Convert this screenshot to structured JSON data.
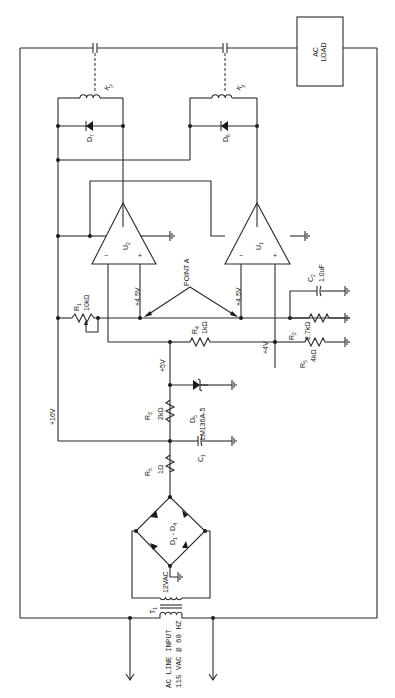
{
  "diagram": {
    "type": "circuit-schematic",
    "orientation": "rotated-90-ccw",
    "blocks": {
      "ac_load": {
        "line1": "AC",
        "line2": "LOAD"
      },
      "ac_input": {
        "line1": "AC LINE INPUT",
        "line2": "115 VAC @ 60 HZ"
      }
    },
    "components": {
      "T1": {
        "ref": "T",
        "sub": "1",
        "value": "12VAC"
      },
      "bridge": {
        "ref": "D",
        "sub1": "1",
        "dash": " - ",
        "ref2": "D",
        "sub2": "4"
      },
      "R5a": {
        "ref": "R",
        "sub": "5",
        "value": "1Ω"
      },
      "C1": {
        "ref": "C",
        "sub": "1"
      },
      "R3": {
        "ref": "R",
        "sub": "3",
        "value": "2kΩ"
      },
      "D5": {
        "ref": "D",
        "sub": "5",
        "value": "LM136A-5"
      },
      "R4": {
        "ref": "R",
        "sub": "4",
        "value": "1kΩ"
      },
      "R1": {
        "ref": "R",
        "sub": "1",
        "value": "10kΩ"
      },
      "R2": {
        "ref": "R",
        "sub": "2",
        "value": "2.7kΩ"
      },
      "R5b": {
        "ref": "R",
        "sub": "5",
        "value": "4kΩ"
      },
      "C2": {
        "ref": "C",
        "sub": "2",
        "value": "1.0uF"
      },
      "U1": {
        "ref": "U",
        "sub": "1"
      },
      "U2": {
        "ref": "U",
        "sub": "2"
      },
      "D6": {
        "ref": "D",
        "sub": "6"
      },
      "D7": {
        "ref": "D",
        "sub": "7"
      },
      "K1": {
        "ref": "K",
        "sub": "1"
      },
      "K2": {
        "ref": "K",
        "sub": "2"
      }
    },
    "voltages": {
      "v16": "+16V",
      "v5": "+5V",
      "v4": "+4V",
      "v45_u2": "+4.5V",
      "v45_u1": "+4.5V"
    },
    "annotations": {
      "point_a": "POINT A",
      "opamp_minus": "−",
      "opamp_plus": "+"
    }
  }
}
